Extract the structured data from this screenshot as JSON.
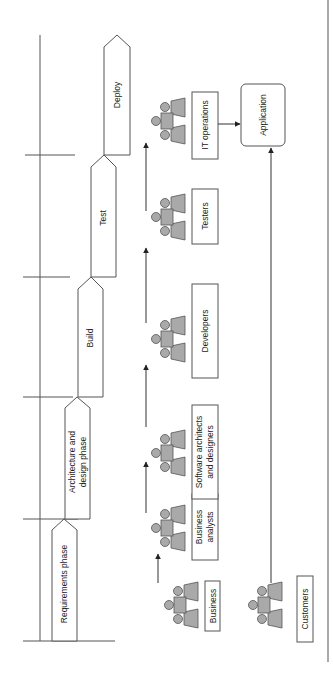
{
  "diagram": {
    "orientation": "rotated-90-ccw",
    "phases": [
      {
        "label": "Requirements phase"
      },
      {
        "label_line1": "Architecture and",
        "label_line2": "design phase"
      },
      {
        "label": "Build"
      },
      {
        "label": "Test"
      },
      {
        "label": "Deploy"
      }
    ],
    "roles": [
      {
        "label": "Business"
      },
      {
        "label_line1": "Business",
        "label_line2": "analysts"
      },
      {
        "label_line1": "Software architects",
        "label_line2": "and designers"
      },
      {
        "label": "Developers"
      },
      {
        "label": "Testers"
      },
      {
        "label": "IT operations"
      }
    ],
    "customers": {
      "label": "Customers"
    },
    "application": {
      "label": "Application"
    },
    "colors": {
      "line": "#555555",
      "person_fill": "#a9a9a9",
      "background": "#ffffff"
    }
  }
}
